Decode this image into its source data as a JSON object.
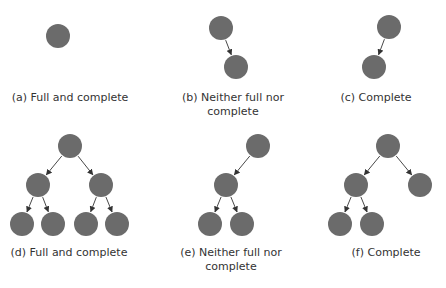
{
  "colors": {
    "node_fill": "#6b6b6b",
    "edge": "#333333",
    "text": "#333333",
    "background": "#ffffff"
  },
  "node_radius": 12,
  "panels": [
    {
      "id": "a",
      "caption": "(a) Full and complete",
      "caption_pos": {
        "x": 70,
        "y": 91
      },
      "nodes": [
        {
          "x": 58,
          "y": 36
        }
      ],
      "edges": []
    },
    {
      "id": "b",
      "caption": "(b) Neither full nor\ncomplete",
      "caption_pos": {
        "x": 233,
        "y": 91
      },
      "nodes": [
        {
          "x": 221,
          "y": 28
        },
        {
          "x": 236,
          "y": 67
        }
      ],
      "edges": [
        [
          0,
          1
        ]
      ]
    },
    {
      "id": "c",
      "caption": "(c) Complete",
      "caption_pos": {
        "x": 376,
        "y": 91
      },
      "nodes": [
        {
          "x": 389,
          "y": 27
        },
        {
          "x": 374,
          "y": 67
        }
      ],
      "edges": [
        [
          0,
          1
        ]
      ]
    },
    {
      "id": "d",
      "caption": "(d) Full and complete",
      "caption_pos": {
        "x": 69,
        "y": 246
      },
      "nodes": [
        {
          "x": 70,
          "y": 146
        },
        {
          "x": 38,
          "y": 185
        },
        {
          "x": 101,
          "y": 185
        },
        {
          "x": 22,
          "y": 224
        },
        {
          "x": 53,
          "y": 224
        },
        {
          "x": 86,
          "y": 224
        },
        {
          "x": 117,
          "y": 224
        }
      ],
      "edges": [
        [
          0,
          1
        ],
        [
          0,
          2
        ],
        [
          1,
          3
        ],
        [
          1,
          4
        ],
        [
          2,
          5
        ],
        [
          2,
          6
        ]
      ]
    },
    {
      "id": "e",
      "caption": "(e) Neither full nor\ncomplete",
      "caption_pos": {
        "x": 231,
        "y": 246
      },
      "nodes": [
        {
          "x": 258,
          "y": 146
        },
        {
          "x": 226,
          "y": 185
        },
        {
          "x": 210,
          "y": 224
        },
        {
          "x": 242,
          "y": 224
        }
      ],
      "edges": [
        [
          0,
          1
        ],
        [
          1,
          2
        ],
        [
          1,
          3
        ]
      ]
    },
    {
      "id": "f",
      "caption": "(f) Complete",
      "caption_pos": {
        "x": 386,
        "y": 246
      },
      "nodes": [
        {
          "x": 388,
          "y": 146
        },
        {
          "x": 356,
          "y": 185
        },
        {
          "x": 420,
          "y": 185
        },
        {
          "x": 340,
          "y": 224
        },
        {
          "x": 372,
          "y": 224
        }
      ],
      "edges": [
        [
          0,
          1
        ],
        [
          0,
          2
        ],
        [
          1,
          3
        ],
        [
          1,
          4
        ]
      ]
    }
  ]
}
